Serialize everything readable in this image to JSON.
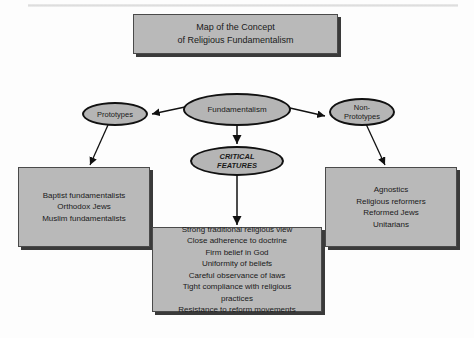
{
  "diagram": {
    "title_box": {
      "text": "Map of the Concept\nof Religious Fundamentalism"
    },
    "nodes": {
      "fundamentalism": {
        "label": "Fundamentalism"
      },
      "prototypes": {
        "label": "Prototypes"
      },
      "non_prototypes": {
        "label": "Non-\nPrototypes"
      },
      "critical_features": {
        "label": "CRITICAL\nFEATURES"
      }
    },
    "boxes": {
      "prototype_examples": {
        "text": "Baptist fundamentalists\nOrthodox Jews\nMuslim fundamentalists"
      },
      "non_prototype_examples": {
        "text": "Agnostics\nReligious reformers\nReformed Jews\nUnitarians"
      },
      "features_list": {
        "text": "Strong traditional religious view\nClose adherence to doctrine\nFirm belief in God\nUniformity of beliefs\nCareful observance of laws\nTight compliance with religious\npractices\nResistance to reform movements"
      }
    },
    "colors": {
      "node_fill": "#b5b5b5",
      "box_fill": "#b9b9b9",
      "stroke": "#111111",
      "shadow": "#3a3a3a",
      "background": "#fdfdfd"
    }
  }
}
